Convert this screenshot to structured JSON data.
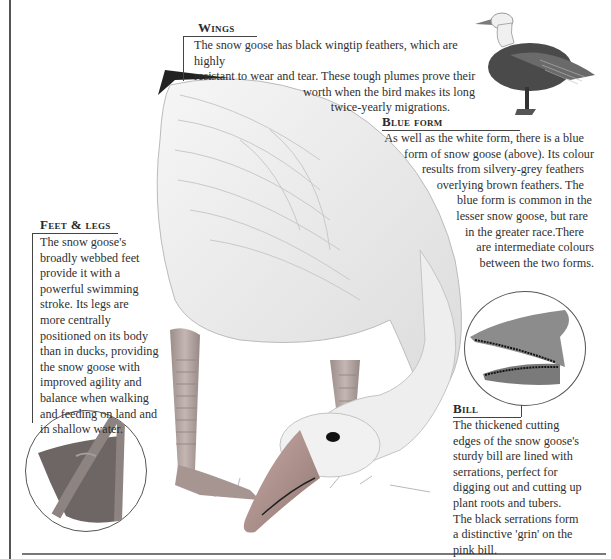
{
  "sections": {
    "wings": {
      "heading": "Wings",
      "lines": [
        "The snow goose has black wingtip feathers, which are highly",
        "resistant to wear and tear. These tough plumes prove their",
        "worth when the bird makes its long",
        "twice-yearly migrations."
      ]
    },
    "blue_form": {
      "heading": "Blue form",
      "lines": [
        "As well as the white form, there is a blue",
        "form of snow goose (above). Its colour",
        "results from silvery-grey feathers",
        "overlying brown feathers. The",
        "blue form is common in the",
        "lesser snow goose, but rare",
        "in the greater race.There",
        "are intermediate colours",
        "between the two forms."
      ]
    },
    "feet_legs": {
      "heading": "Feet & legs",
      "lines": [
        "The snow goose's",
        "broadly webbed feet",
        "provide it with a",
        "powerful swimming",
        "stroke. Its legs are",
        "more centrally",
        "positioned on its body",
        "than in ducks, providing",
        "the snow goose with",
        "improved agility and",
        "balance when walking",
        "and feeding on land and",
        "in shallow water."
      ]
    },
    "bill": {
      "heading": "Bill",
      "lines": [
        "The thickened cutting",
        "edges of the snow goose's",
        "sturdy bill are lined with",
        "serrations, perfect for",
        "digging out and cutting up",
        "plant roots and tubers.",
        "The black serrations form",
        "a distinctive 'grin' on the",
        "pink bill."
      ]
    }
  },
  "illustrations": {
    "main": "snow-goose-feeding-illustration",
    "inset_top_right": "blue-form-snow-goose",
    "inset_foot": "webbed-foot-closeup",
    "inset_bill": "serrated-bill-closeup"
  },
  "colors": {
    "text": "#2f2f2f",
    "rule": "#444444",
    "bill_pink": "#c7a49e",
    "legs": "#b9a7a3"
  }
}
